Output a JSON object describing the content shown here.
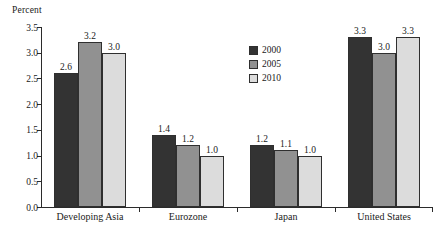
{
  "chart_data": {
    "type": "bar",
    "title": "",
    "subtitle": "",
    "xlabel": "",
    "ylabel": "Percent",
    "ylim": [
      0.0,
      3.5
    ],
    "ytick_labels": [
      "0.0",
      "0.5",
      "1.0",
      "1.5",
      "2.0",
      "2.5",
      "3.0",
      "3.5"
    ],
    "ytick_values": [
      0.0,
      0.5,
      1.0,
      1.5,
      2.0,
      2.5,
      3.0,
      3.5
    ],
    "grid": false,
    "legend_position": "upper-center-right",
    "categories": [
      "Developing Asia",
      "Eurozone",
      "Japan",
      "United States"
    ],
    "series": [
      {
        "name": "2000",
        "color": "#333333",
        "values": [
          2.6,
          1.4,
          1.2,
          3.3
        ],
        "labels": [
          "2.6",
          "1.4",
          "1.2",
          "3.3"
        ]
      },
      {
        "name": "2005",
        "color": "#919191",
        "values": [
          3.2,
          1.2,
          1.1,
          3.0
        ],
        "labels": [
          "3.2",
          "1.2",
          "1.1",
          "3.0"
        ]
      },
      {
        "name": "2010",
        "color": "#dcdcdc",
        "values": [
          3.0,
          1.0,
          1.0,
          3.3
        ],
        "labels": [
          "3.0",
          "1.0",
          "1.0",
          "3.3"
        ]
      }
    ],
    "axis_color": "#2b2b2b",
    "bar_border_color": "#2f2f2f",
    "background": "#ffffff"
  }
}
